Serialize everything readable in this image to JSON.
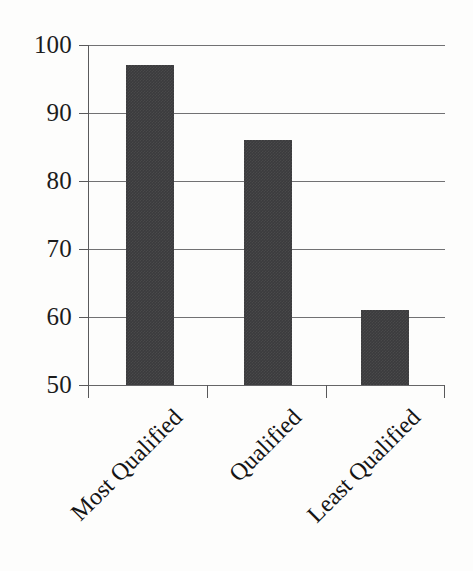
{
  "chart_data": {
    "type": "bar",
    "title": "",
    "subtitle": "",
    "xlabel": "",
    "ylabel": "",
    "categories": [
      "Most Qualified",
      "Qualified",
      "Least Qualified"
    ],
    "values": [
      97,
      86,
      61
    ],
    "ylim": [
      50,
      100
    ],
    "yticks": [
      50,
      60,
      70,
      80,
      90,
      100
    ],
    "ytick_labels": [
      "50",
      "60",
      "70",
      "80",
      "90",
      "100"
    ],
    "grid": true,
    "grid_axis": "y",
    "legend": false,
    "legend_position": "none",
    "bar_color": "#3b3b3d",
    "gridline_color": "#58585a",
    "axis_color": "#5a5a5c",
    "text_color": "#151515",
    "background_color": "#fdfdfc",
    "xtick_label_rotation": -45
  }
}
